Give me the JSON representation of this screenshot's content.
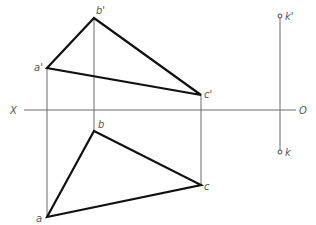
{
  "diagram": {
    "type": "orthographic-projection",
    "axis": {
      "left_label": "X",
      "right_label": "O",
      "y": 110,
      "x_start": 24,
      "x_end": 296
    },
    "colors": {
      "edge": "#111111",
      "projector": "#6a6a6a",
      "label": "#555555"
    },
    "front_view": {
      "points": [
        {
          "name": "a'",
          "x": 47,
          "y": 68
        },
        {
          "name": "b'",
          "x": 94,
          "y": 18
        },
        {
          "name": "c'",
          "x": 201,
          "y": 95
        }
      ]
    },
    "top_view": {
      "points": [
        {
          "name": "a",
          "x": 47,
          "y": 217
        },
        {
          "name": "b",
          "x": 94,
          "y": 131
        },
        {
          "name": "c",
          "x": 201,
          "y": 185
        }
      ]
    },
    "point_k": {
      "front": {
        "name": "k'",
        "x": 280,
        "y": 16
      },
      "top": {
        "name": "k",
        "x": 280,
        "y": 152
      }
    },
    "labels": {
      "a_prime": "a'",
      "b_prime": "b'",
      "c_prime": "c'",
      "a": "a",
      "b": "b",
      "c": "c",
      "k_prime": "k'",
      "k": "k",
      "x_axis": "X",
      "o_axis": "O"
    }
  }
}
